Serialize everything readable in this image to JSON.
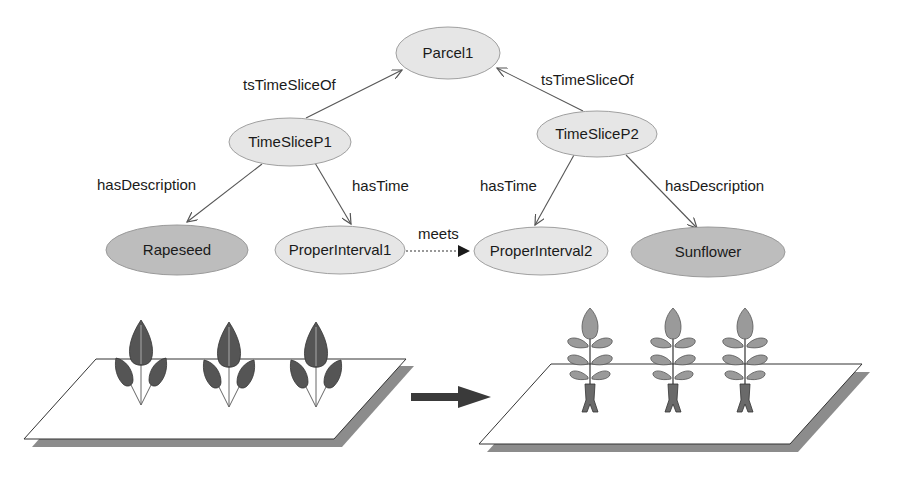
{
  "graph": {
    "nodes": [
      {
        "id": "parcel1",
        "label": "Parcel1",
        "style": "light",
        "cx": 448,
        "cy": 53,
        "rx": 52,
        "ry": 26
      },
      {
        "id": "timesliceP1",
        "label": "TimeSliceP1",
        "style": "light",
        "cx": 290,
        "cy": 142,
        "rx": 61,
        "ry": 24
      },
      {
        "id": "timesliceP2",
        "label": "TimeSliceP2",
        "style": "light",
        "cx": 597,
        "cy": 134,
        "rx": 60,
        "ry": 23
      },
      {
        "id": "rapeseed",
        "label": "Rapeseed",
        "style": "dark",
        "cx": 177,
        "cy": 250,
        "rx": 71,
        "ry": 25
      },
      {
        "id": "properInterval1",
        "label": "ProperInterval1",
        "style": "light",
        "cx": 340,
        "cy": 250,
        "rx": 65,
        "ry": 24
      },
      {
        "id": "properInterval2",
        "label": "ProperInterval2",
        "style": "light",
        "cx": 541,
        "cy": 251,
        "rx": 67,
        "ry": 24
      },
      {
        "id": "sunflower",
        "label": "Sunflower",
        "style": "dark",
        "cx": 708,
        "cy": 252,
        "rx": 77,
        "ry": 25
      }
    ],
    "edges": [
      {
        "from": "timesliceP1",
        "to": "parcel1",
        "label": "tsTimeSliceOf",
        "style": "solid"
      },
      {
        "from": "timesliceP2",
        "to": "parcel1",
        "label": "tsTimeSliceOf",
        "style": "solid"
      },
      {
        "from": "timesliceP1",
        "to": "rapeseed",
        "label": "hasDescription",
        "style": "solid"
      },
      {
        "from": "timesliceP1",
        "to": "properInterval1",
        "label": "hasTime",
        "style": "solid"
      },
      {
        "from": "timesliceP2",
        "to": "properInterval2",
        "label": "hasTime",
        "style": "solid"
      },
      {
        "from": "timesliceP2",
        "to": "sunflower",
        "label": "hasDescription",
        "style": "solid"
      },
      {
        "from": "properInterval1",
        "to": "properInterval2",
        "label": "meets",
        "style": "dotted"
      }
    ]
  },
  "labels": {
    "parcel1": "Parcel1",
    "timesliceP1": "TimeSliceP1",
    "timesliceP2": "TimeSliceP2",
    "rapeseed": "Rapeseed",
    "properInterval1": "ProperInterval1",
    "properInterval2": "ProperInterval2",
    "sunflower": "Sunflower",
    "edge_ts1": "tsTimeSliceOf",
    "edge_ts2": "tsTimeSliceOf",
    "edge_desc1": "hasDescription",
    "edge_time1": "hasTime",
    "edge_time2": "hasTime",
    "edge_desc2": "hasDescription",
    "edge_meets": "meets"
  },
  "illustration": {
    "left_field": {
      "crop": "rapeseed",
      "plant_count": 3
    },
    "transition_arrow": "arrow-right",
    "right_field": {
      "crop": "sunflower",
      "plant_count": 3
    }
  },
  "colors": {
    "node_light": "#e6e6e6",
    "node_dark": "#bdbdbd",
    "edge": "#555555",
    "field_shadow": "#8c8c8c",
    "arrow": "#3a3a3a"
  }
}
